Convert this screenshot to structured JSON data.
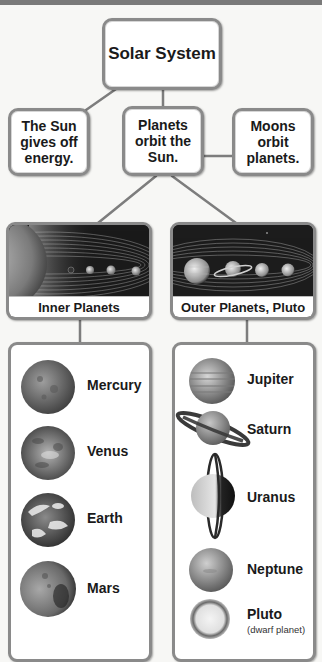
{
  "diagram": {
    "title": "Solar System",
    "level2": [
      {
        "id": "sun",
        "text": "The Sun\ngives off\nenergy."
      },
      {
        "id": "planets",
        "text": "Planets\norbit the\nSun."
      },
      {
        "id": "moons",
        "text": "Moons\norbit\nplanets."
      }
    ],
    "groups": [
      {
        "label": "Inner Planets",
        "items": [
          {
            "name": "Mercury"
          },
          {
            "name": "Venus"
          },
          {
            "name": "Earth"
          },
          {
            "name": "Mars"
          }
        ]
      },
      {
        "label": "Outer Planets, Pluto",
        "items": [
          {
            "name": "Jupiter"
          },
          {
            "name": "Saturn"
          },
          {
            "name": "Uranus"
          },
          {
            "name": "Neptune"
          },
          {
            "name": "Pluto",
            "note": "(dwarf planet)"
          }
        ]
      }
    ]
  },
  "colors": {
    "border": "#8a8a8a",
    "connector": "#7d7d7d",
    "top_bar": "#7a7a7a",
    "text": "#1a1a1a"
  }
}
